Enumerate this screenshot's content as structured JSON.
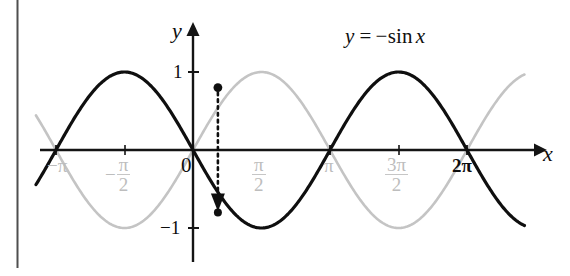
{
  "figure": {
    "background_color": "#ffffff"
  },
  "equation_label": {
    "lhs": "y",
    "equals": "=",
    "minus": "−",
    "function": "sin",
    "variable": "x",
    "full_text": "y = −sin x",
    "color": "#101010"
  },
  "axes": {
    "x_axis_name": "x",
    "y_axis_name": "y",
    "origin_label": "0",
    "x_ticks": [
      {
        "label": "−π",
        "value": -3.14159,
        "style": "gray",
        "numerator": "",
        "denominator": ""
      },
      {
        "label": "−π/2",
        "value": -1.5708,
        "style": "gray",
        "numerator": "π",
        "denominator": "2",
        "sign": "−"
      },
      {
        "label": "0",
        "value": 0,
        "style": "dark"
      },
      {
        "label": "π/2",
        "value": 1.5708,
        "style": "gray",
        "numerator": "π",
        "denominator": "2"
      },
      {
        "label": "π",
        "value": 3.14159,
        "style": "gray"
      },
      {
        "label": "3π/2",
        "value": 4.71239,
        "style": "gray",
        "numerator": "3π",
        "denominator": "2"
      },
      {
        "label": "2π",
        "value": 6.28319,
        "style": "dark"
      }
    ],
    "y_ticks": [
      {
        "label": "1",
        "value": 1
      },
      {
        "label": "−1",
        "value": -1
      }
    ],
    "x_range": [
      -3.6,
      7.6
    ],
    "y_range": [
      -1.35,
      1.35
    ],
    "grid": false,
    "axis_color": "#141414"
  },
  "chart_data": {
    "type": "line",
    "title": "",
    "xlabel": "x",
    "ylabel": "y",
    "xlim": [
      -3.6,
      7.6
    ],
    "ylim": [
      -1.35,
      1.35
    ],
    "grid": false,
    "legend": "none",
    "series": [
      {
        "name": "y = −sin x",
        "expression": "-sin(x)",
        "color": "#0f0f0f",
        "width": 3.2,
        "style": "solid",
        "labeled": true,
        "samples_x": [
          -3.6,
          -3.14159,
          -2.35619,
          -1.5708,
          -0.785398,
          0,
          0.785398,
          1.5708,
          2.35619,
          3.14159,
          3.92699,
          4.71239,
          5.49779,
          6.28319,
          7.06858,
          7.6
        ],
        "samples_y": [
          -0.4425,
          0,
          0.7071,
          1,
          0.7071,
          0,
          -0.7071,
          -1,
          -0.7071,
          0,
          0.7071,
          1,
          0.7071,
          0,
          -0.7071,
          -0.9516
        ]
      },
      {
        "name": "y = sin x",
        "expression": "sin(x)",
        "color": "#c4c4c4",
        "width": 2.6,
        "style": "solid",
        "labeled": false,
        "samples_x": [
          -3.6,
          -3.14159,
          -2.35619,
          -1.5708,
          -0.785398,
          0,
          0.785398,
          1.5708,
          2.35619,
          3.14159,
          3.92699,
          4.71239,
          5.49779,
          6.28319,
          7.06858,
          7.6
        ],
        "samples_y": [
          0.4425,
          0,
          -0.7071,
          -1,
          -0.7071,
          0,
          0.7071,
          1,
          0.7071,
          0,
          -0.7071,
          -1,
          -0.7071,
          0,
          0.7071,
          0.9516
        ]
      }
    ],
    "annotations": [
      {
        "type": "point",
        "name": "reflection-source-point",
        "x": 0.57,
        "y": 0.8,
        "color": "#0f0f0f"
      },
      {
        "type": "point",
        "name": "reflection-target-point",
        "x": 0.57,
        "y": -0.8,
        "color": "#0f0f0f"
      },
      {
        "type": "arrow",
        "name": "reflection-arrow",
        "style": "dotted",
        "from_x": 0.57,
        "from_y": 0.8,
        "to_x": 0.57,
        "to_y": -0.8,
        "color": "#0f0f0f"
      }
    ]
  },
  "scan_artifacts": {
    "left_page_edge": {
      "present": true,
      "color": "#555555"
    }
  }
}
